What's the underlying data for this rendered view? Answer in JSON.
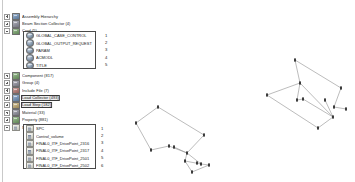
{
  "tree": {
    "items": [
      {
        "label": "Assembly Hierarchy",
        "icon": "assembly-icon",
        "icon_style": "blue",
        "expander": "plus",
        "indent": 0,
        "highlighted": false
      },
      {
        "label": "Beam Section Collector (4)",
        "icon": "beam-section-icon",
        "icon_style": "slate",
        "expander": "plus",
        "indent": 0,
        "highlighted": false
      },
      {
        "label": "Card (5)",
        "icon": "card-icon",
        "icon_style": "green",
        "expander": "minus",
        "indent": 0,
        "highlighted": true
      },
      {
        "label": "Component (817)",
        "icon": "component-icon",
        "icon_style": "green",
        "expander": "plus",
        "indent": 0,
        "highlighted": false
      },
      {
        "label": "Group (4)",
        "icon": "group-icon",
        "icon_style": "slate",
        "expander": "plus",
        "indent": 0,
        "highlighted": false
      },
      {
        "label": "Include File (7)",
        "icon": "include-file-icon",
        "icon_style": "red",
        "expander": "plus",
        "indent": 0,
        "highlighted": false
      },
      {
        "label": "Load Collector (493)",
        "icon": "load-collector-icon",
        "icon_style": "blue",
        "expander": "plus",
        "indent": 0,
        "highlighted": true
      },
      {
        "label": "Load Step (182)",
        "icon": "load-step-icon",
        "icon_style": "amber",
        "expander": "plus",
        "indent": 0,
        "highlighted": true
      },
      {
        "label": "Material (33)",
        "icon": "material-icon",
        "icon_style": "slate",
        "expander": "plus",
        "indent": 0,
        "highlighted": false
      },
      {
        "label": "Property (881)",
        "icon": "property-icon",
        "icon_style": "green",
        "expander": "plus",
        "indent": 0,
        "highlighted": false
      },
      {
        "label": "Set (38)",
        "icon": "set-icon",
        "icon_style": "sheet",
        "expander": "minus",
        "indent": 0,
        "highlighted": true
      }
    ]
  },
  "card_callout": {
    "rows": [
      {
        "label": "GLOBAL_CASE_CONTROL",
        "number": "1",
        "icon": "card-entity-icon"
      },
      {
        "label": "GLOBAL_OUTPUT_REQUEST",
        "number": "2",
        "icon": "card-entity-icon"
      },
      {
        "label": "PARAM",
        "number": "3",
        "icon": "card-entity-icon"
      },
      {
        "label": "ACMODL",
        "number": "4",
        "icon": "card-entity-icon"
      },
      {
        "label": "TITLE",
        "number": "5",
        "icon": "card-entity-icon"
      }
    ]
  },
  "set_callout": {
    "rows": [
      {
        "label": "SPC",
        "number": "1",
        "icon": "set-entity-icon"
      },
      {
        "label": "Control_volume",
        "number": "2",
        "icon": "set-entity-icon"
      },
      {
        "label": "FINAL0_ITF_DrivePoint_2316",
        "number": "3",
        "icon": "set-entity-icon"
      },
      {
        "label": "FINAL0_ITF_DrivePoint_2317",
        "number": "4",
        "icon": "set-entity-icon"
      },
      {
        "label": "FINAL0_ITF_DrivePoint_2501",
        "number": "5",
        "icon": "set-entity-icon"
      },
      {
        "label": "FINAL0_ITF_DrivePoint_2502",
        "number": "6",
        "icon": "set-entity-icon"
      }
    ]
  },
  "graphics": {
    "left_wireframe": {
      "name": "left-wireframe-model",
      "line_color": "#8f8f8f",
      "node_color": "#2b2b2b",
      "nodes": [
        {
          "x": 30,
          "y": 41
        },
        {
          "x": 8,
          "y": 57
        },
        {
          "x": 23,
          "y": 84
        },
        {
          "x": 76,
          "y": 69
        },
        {
          "x": 41,
          "y": 80
        },
        {
          "x": 46,
          "y": 81
        },
        {
          "x": 59,
          "y": 87
        },
        {
          "x": 57,
          "y": 95
        },
        {
          "x": 69,
          "y": 97
        },
        {
          "x": 73,
          "y": 98
        },
        {
          "x": 81,
          "y": 99
        },
        {
          "x": 64,
          "y": 106
        }
      ],
      "edges": [
        [
          0,
          1
        ],
        [
          1,
          2
        ],
        [
          0,
          3
        ],
        [
          2,
          4
        ],
        [
          4,
          6
        ],
        [
          3,
          6
        ],
        [
          5,
          6
        ],
        [
          6,
          7
        ],
        [
          7,
          11
        ],
        [
          11,
          10
        ],
        [
          7,
          9
        ],
        [
          9,
          10
        ],
        [
          6,
          9
        ]
      ]
    },
    "right_wireframe": {
      "name": "right-wireframe-model",
      "line_color": "#8f8f8f",
      "node_color": "#2b2b2b",
      "nodes": [
        {
          "x": 50,
          "y": 2
        },
        {
          "x": 55,
          "y": 25
        },
        {
          "x": 96,
          "y": 30
        },
        {
          "x": 22,
          "y": 37
        },
        {
          "x": 52,
          "y": 42
        },
        {
          "x": 58,
          "y": 41
        },
        {
          "x": 80,
          "y": 42
        },
        {
          "x": 89,
          "y": 49
        },
        {
          "x": 101,
          "y": 51
        },
        {
          "x": 88,
          "y": 59
        },
        {
          "x": 73,
          "y": 70
        }
      ],
      "edges": [
        [
          0,
          1
        ],
        [
          0,
          2
        ],
        [
          1,
          3
        ],
        [
          1,
          4
        ],
        [
          1,
          9
        ],
        [
          2,
          7
        ],
        [
          7,
          8
        ],
        [
          3,
          10
        ],
        [
          5,
          9
        ],
        [
          9,
          10
        ],
        [
          4,
          5
        ],
        [
          6,
          9
        ]
      ]
    }
  }
}
